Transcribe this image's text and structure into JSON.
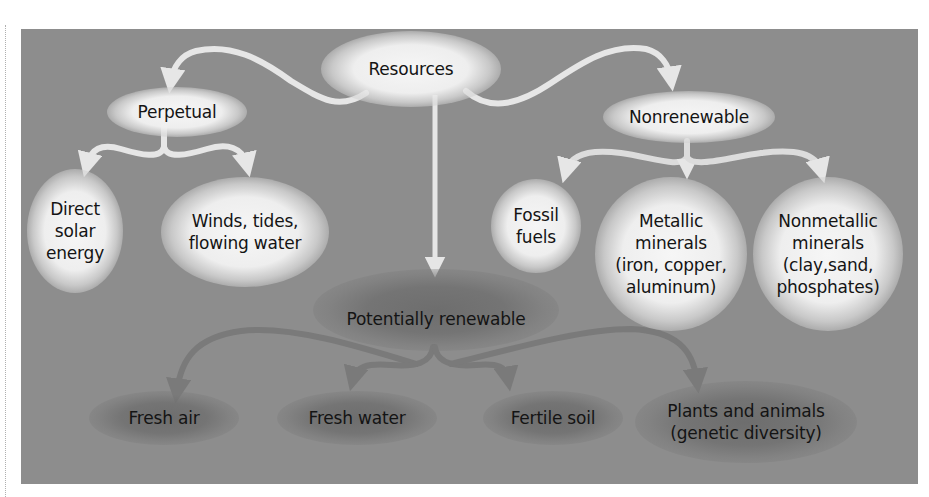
{
  "diagram": {
    "title": "Resources",
    "colors": {
      "panel_background": "#8d8d8d",
      "light_node_glow": "#f2f2f2",
      "dark_node_glow": "#6e6e6e",
      "light_arrow": "#e6e6e6",
      "dark_arrow": "#7a7a7a",
      "text": "#141414"
    },
    "nodes": {
      "resources": "Resources",
      "perpetual": "Perpetual",
      "nonrenewable": "Nonrenewable",
      "potentially_renewable": "Potentially renewable",
      "direct_solar": "Direct\nsolar\nenergy",
      "winds_tides": "Winds, tides,\nflowing water",
      "fossil_fuels": "Fossil\nfuels",
      "metallic_minerals": "Metallic\nminerals\n(iron, copper,\naluminum)",
      "nonmetallic_minerals": "Nonmetallic\nminerals\n(clay,sand,\nphosphates)",
      "fresh_air": "Fresh air",
      "fresh_water": "Fresh water",
      "fertile_soil": "Fertile soil",
      "plants_animals": "Plants and animals\n(genetic diversity)"
    },
    "edges": [
      {
        "from": "Resources",
        "to": "Perpetual"
      },
      {
        "from": "Resources",
        "to": "Nonrenewable"
      },
      {
        "from": "Resources",
        "to": "Potentially renewable"
      },
      {
        "from": "Perpetual",
        "to": "Direct solar energy"
      },
      {
        "from": "Perpetual",
        "to": "Winds, tides, flowing water"
      },
      {
        "from": "Nonrenewable",
        "to": "Fossil fuels"
      },
      {
        "from": "Nonrenewable",
        "to": "Metallic minerals"
      },
      {
        "from": "Nonrenewable",
        "to": "Nonmetallic minerals"
      },
      {
        "from": "Potentially renewable",
        "to": "Fresh air"
      },
      {
        "from": "Potentially renewable",
        "to": "Fresh water"
      },
      {
        "from": "Potentially renewable",
        "to": "Fertile soil"
      },
      {
        "from": "Potentially renewable",
        "to": "Plants and animals"
      }
    ]
  }
}
